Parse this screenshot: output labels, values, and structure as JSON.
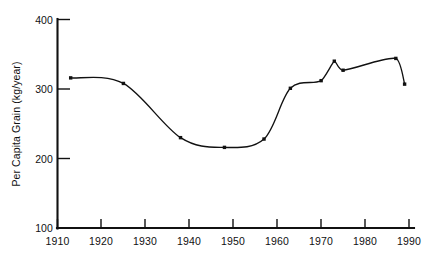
{
  "chart_data": {
    "type": "line",
    "title": "",
    "subtitle": "",
    "xlabel": "",
    "ylabel": "Per Capita Grain (kg/year)",
    "xlim": [
      1910,
      1990
    ],
    "ylim": [
      100,
      400
    ],
    "xticks": [
      1910,
      1920,
      1930,
      1940,
      1950,
      1960,
      1970,
      1980,
      1990
    ],
    "xtick_labels": [
      "1910",
      "1920",
      "1930",
      "1940",
      "1950",
      "1960",
      "1970",
      "1980",
      "1990"
    ],
    "yticks": [
      100,
      200,
      300,
      400
    ],
    "ytick_labels": [
      "100",
      "200",
      "300",
      "400"
    ],
    "grid": false,
    "legend": false,
    "legend_position": "none",
    "line_color": "#111111",
    "marker": "square-dot",
    "series": [
      {
        "name": "Per Capita Grain",
        "x": [
          1913,
          1925,
          1938,
          1948,
          1957,
          1963,
          1970,
          1973,
          1975,
          1987,
          1989
        ],
        "values": [
          316,
          308,
          230,
          216,
          228,
          301,
          312,
          340,
          327,
          344,
          307
        ]
      }
    ]
  },
  "axes": {
    "y_axis_title": "Per Capita Grain (kg/year)"
  }
}
